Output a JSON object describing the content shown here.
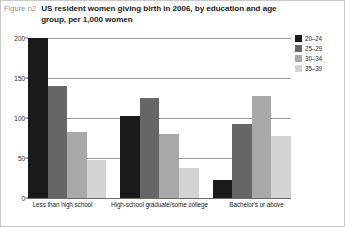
{
  "figure": {
    "number_label": "Figure n2",
    "title": "US resident women giving birth in 2006, by education and age group, per 1,000 women"
  },
  "chart_data": {
    "type": "bar",
    "title": "US resident women giving birth in 2006, by education and age group, per 1,000 women",
    "xlabel": "",
    "ylabel": "",
    "ylim": [
      0,
      200
    ],
    "yticks": [
      0,
      50,
      100,
      150,
      200
    ],
    "grid": true,
    "legend_position": "top-right",
    "categories": [
      "Less than high school",
      "High-school graduate/some college",
      "Bachelor's or above"
    ],
    "series": [
      {
        "name": "20–24",
        "color": "#1a1a1a",
        "values": [
          200,
          103,
          22
        ]
      },
      {
        "name": "25–29",
        "color": "#666666",
        "values": [
          140,
          125,
          92
        ]
      },
      {
        "name": "30–34",
        "color": "#a8a8a8",
        "values": [
          83,
          80,
          128
        ]
      },
      {
        "name": "35–39",
        "color": "#d4d4d4",
        "values": [
          48,
          38,
          78
        ]
      }
    ]
  },
  "colors": {
    "gridline": "#9a9a9a",
    "axis": "#6b6b6b",
    "background": "#ffffff",
    "frame": "#c9c9c9",
    "fig_num_text": "#8d8f92",
    "title_text": "#1b1b1b"
  }
}
